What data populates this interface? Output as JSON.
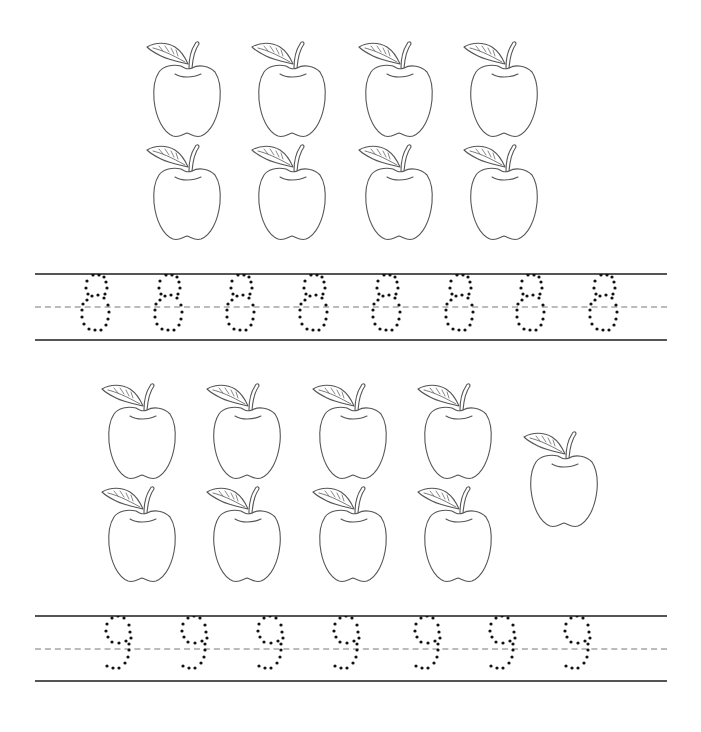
{
  "worksheet": {
    "sections": [
      {
        "number": 8,
        "digit": "8",
        "apple_count": 8,
        "apples": [
          {
            "x": 145,
            "y": 38
          },
          {
            "x": 250,
            "y": 38
          },
          {
            "x": 357,
            "y": 38
          },
          {
            "x": 462,
            "y": 38
          },
          {
            "x": 145,
            "y": 141
          },
          {
            "x": 250,
            "y": 141
          },
          {
            "x": 357,
            "y": 141
          },
          {
            "x": 462,
            "y": 141
          }
        ],
        "tracing_row": {
          "top_y": 274,
          "mid_y": 307,
          "bottom_y": 340,
          "glyph_count": 8,
          "glyph_centers_x": [
            95,
            168,
            240,
            313,
            386,
            459,
            530,
            603
          ]
        }
      },
      {
        "number": 9,
        "digit": "9",
        "apple_count": 9,
        "apples": [
          {
            "x": 100,
            "y": 380
          },
          {
            "x": 205,
            "y": 380
          },
          {
            "x": 311,
            "y": 380
          },
          {
            "x": 416,
            "y": 380
          },
          {
            "x": 100,
            "y": 483
          },
          {
            "x": 205,
            "y": 483
          },
          {
            "x": 311,
            "y": 483
          },
          {
            "x": 416,
            "y": 483
          },
          {
            "x": 522,
            "y": 428
          }
        ],
        "tracing_row": {
          "top_y": 616,
          "mid_y": 649,
          "bottom_y": 681,
          "glyph_count": 7,
          "glyph_centers_x": [
            115,
            191,
            267,
            343,
            424,
            499,
            574
          ]
        }
      }
    ],
    "colors": {
      "outline": "#555555",
      "dots": "#111111",
      "guide_line": "#555555",
      "dashed_guide": "#bbbbbb",
      "background": "#ffffff"
    }
  }
}
